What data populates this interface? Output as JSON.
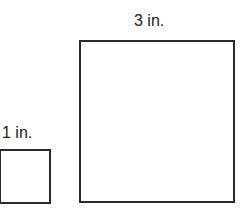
{
  "squares": [
    {
      "name": "small-square",
      "label": "1 in."
    },
    {
      "name": "large-square",
      "label": "3 in."
    }
  ]
}
